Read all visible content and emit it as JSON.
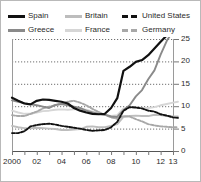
{
  "legend": {
    "columns": [
      [
        {
          "label": "Spain",
          "color": "#111111",
          "style": "solid",
          "icon": "legend-line-swatch"
        },
        {
          "label": "Greece",
          "color": "#8a8a8a",
          "style": "solid",
          "icon": "legend-line-swatch"
        }
      ],
      [
        {
          "label": "Britain",
          "color": "#bdbdbd",
          "style": "solid",
          "icon": "legend-line-swatch"
        },
        {
          "label": "France",
          "color": "#d6d6d6",
          "style": "solid",
          "icon": "legend-line-swatch"
        }
      ],
      [
        {
          "label": "United States",
          "color": "#111111",
          "style": "dashed",
          "icon": "legend-dash-swatch"
        },
        {
          "label": "Germany",
          "color": "#a8a8a8",
          "style": "dashed",
          "icon": "legend-dash-swatch"
        }
      ]
    ]
  },
  "axes": {
    "y_ticks": [
      "0",
      "5",
      "10",
      "15",
      "20",
      "25"
    ],
    "y_tick_side": "right",
    "ylim": [
      0,
      25
    ],
    "x_ticks": [
      "2000",
      "02",
      "04",
      "06",
      "08",
      "10",
      "12",
      "13"
    ],
    "xlim": [
      2000,
      2013
    ],
    "grid": "horizontal-dotted"
  },
  "chart_data": {
    "type": "line",
    "title": "",
    "subtitle": "",
    "xlabel": "",
    "ylabel": "",
    "xlim": [
      2000,
      2013
    ],
    "ylim": [
      0,
      25
    ],
    "grid": true,
    "legend_position": "top",
    "x": [
      2000,
      2000.5,
      2001,
      2001.5,
      2002,
      2002.5,
      2003,
      2003.5,
      2004,
      2004.5,
      2005,
      2005.5,
      2006,
      2006.5,
      2007,
      2007.5,
      2008,
      2008.5,
      2009,
      2009.5,
      2010,
      2010.5,
      2011,
      2011.5,
      2012,
      2012.5,
      2013,
      2013.4
    ],
    "series": [
      {
        "name": "Spain",
        "color": "#111111",
        "style": "solid",
        "values": [
          11.9,
          11.2,
          10.6,
          10.4,
          11.2,
          11.5,
          11.4,
          11.2,
          11.0,
          10.6,
          9.6,
          9.0,
          8.6,
          8.3,
          8.2,
          8.3,
          9.6,
          11.8,
          17.9,
          18.8,
          19.9,
          20.3,
          21.4,
          22.9,
          24.4,
          25.8,
          26.2,
          25.9
        ]
      },
      {
        "name": "Greece",
        "color": "#8a8a8a",
        "style": "solid",
        "values": [
          11.3,
          11.0,
          10.7,
          10.4,
          10.2,
          9.9,
          9.6,
          10.3,
          10.5,
          10.2,
          9.9,
          9.6,
          9.0,
          8.6,
          8.3,
          8.1,
          7.7,
          7.6,
          9.1,
          10.2,
          12.2,
          13.6,
          16.0,
          18.0,
          21.5,
          24.6,
          26.8,
          27.0
        ]
      },
      {
        "name": "Britain",
        "color": "#bdbdbd",
        "style": "solid",
        "values": [
          5.6,
          5.3,
          5.1,
          5.1,
          5.2,
          5.1,
          5.0,
          4.9,
          4.7,
          4.7,
          4.8,
          4.9,
          5.4,
          5.5,
          5.3,
          5.3,
          5.6,
          6.0,
          7.6,
          7.8,
          7.9,
          7.8,
          7.8,
          8.1,
          8.0,
          7.8,
          7.7,
          7.7
        ]
      },
      {
        "name": "France",
        "color": "#d6d6d6",
        "style": "solid",
        "values": [
          9.0,
          8.6,
          8.3,
          8.3,
          8.6,
          8.9,
          9.0,
          9.2,
          9.3,
          9.2,
          9.3,
          9.3,
          9.2,
          8.8,
          8.4,
          8.0,
          7.8,
          8.0,
          9.5,
          9.8,
          9.7,
          9.6,
          9.6,
          9.8,
          10.2,
          10.5,
          10.8,
          11.0
        ]
      },
      {
        "name": "United States",
        "color": "#111111",
        "style": "dashed",
        "values": [
          4.0,
          4.0,
          4.4,
          5.5,
          5.8,
          6.0,
          6.1,
          5.9,
          5.6,
          5.4,
          5.2,
          5.0,
          4.7,
          4.5,
          4.6,
          4.7,
          5.3,
          6.5,
          9.0,
          9.8,
          9.7,
          9.5,
          9.0,
          8.8,
          8.2,
          7.9,
          7.5,
          7.4
        ]
      },
      {
        "name": "Germany",
        "color": "#a8a8a8",
        "style": "dashed",
        "values": [
          8.0,
          7.8,
          7.8,
          8.3,
          8.8,
          9.5,
          9.9,
          10.2,
          10.6,
          11.0,
          11.2,
          10.8,
          10.2,
          9.4,
          8.7,
          8.1,
          7.5,
          7.2,
          7.8,
          7.7,
          7.1,
          6.6,
          6.0,
          5.7,
          5.5,
          5.4,
          5.3,
          5.3
        ]
      }
    ]
  }
}
